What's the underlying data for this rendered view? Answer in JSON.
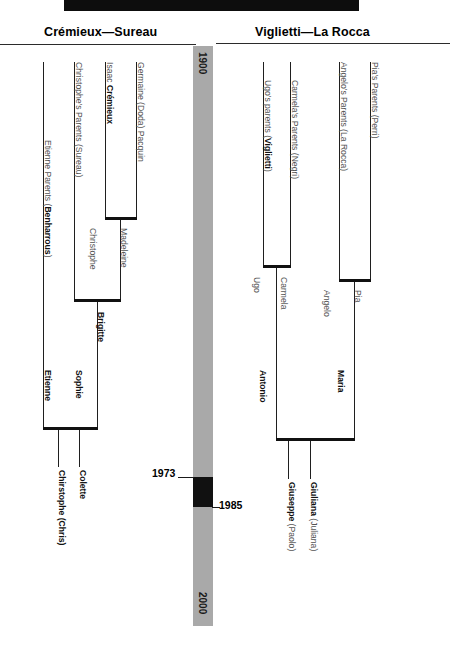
{
  "headers": {
    "left": "Crémieux—Sureau",
    "right": "Viglietti—La Rocca"
  },
  "timeline": {
    "start_label": "1900",
    "end_label": "2000",
    "highlight_start": "1973",
    "highlight_end": "1985",
    "bar_color": "#a9a9a9",
    "highlight_color": "#111111"
  },
  "left_tree": {
    "generation_1": [
      {
        "label": "Germaine (Doda) Pacquin",
        "bold": false
      },
      {
        "label": "Isaac Crémieux",
        "bold_part": "Crémieux"
      },
      {
        "label": "Christophe's Parents (Sureau)",
        "bold": false
      },
      {
        "label": "Etienne Parents (Benharrous)",
        "bold_part": "Benharrous"
      }
    ],
    "generation_2": [
      {
        "label": "Madeleine",
        "bold": false
      },
      {
        "label": "Christophe",
        "bold": false
      },
      {
        "label": "Etienne",
        "bold": true
      }
    ],
    "generation_3": [
      {
        "label": "Brigitte",
        "bold": true
      },
      {
        "label": "Sophie",
        "bold": true
      }
    ],
    "generation_4": [
      {
        "label": "Colette",
        "bold": true
      },
      {
        "label": "Chirstophe (Chris)",
        "bold": true
      }
    ]
  },
  "right_tree": {
    "generation_1": [
      {
        "label": "Pia's Parents (Perri)",
        "bold": false
      },
      {
        "label": "Angelo's Parents (La Rocca)",
        "bold": false
      },
      {
        "label": "Carmela's Parents (Negri)",
        "bold": false
      },
      {
        "label": "Ugo's parents (Viglietti)",
        "bold_part": "Viglietti"
      }
    ],
    "generation_2": [
      {
        "label": "Pia",
        "bold": false
      },
      {
        "label": "Angelo",
        "bold": false
      },
      {
        "label": "Carmela",
        "bold": false
      },
      {
        "label": "Ugo",
        "bold": false
      }
    ],
    "generation_3": [
      {
        "label": "Maria",
        "bold": true
      },
      {
        "label": "Antonio",
        "bold": true
      }
    ],
    "generation_4": [
      {
        "label": "Giuliana (Juliana)",
        "bold_part": "Giuliana"
      },
      {
        "label": "Giuseppe (Paolo)",
        "bold_part": "Giuseppe"
      }
    ]
  }
}
